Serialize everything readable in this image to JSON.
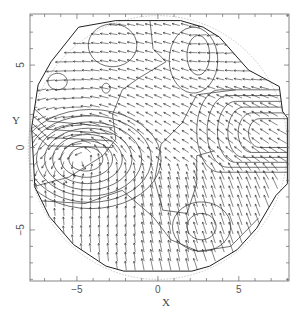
{
  "chart_data": {
    "type": "quiver",
    "title": "",
    "xlabel": "X",
    "ylabel": "Y",
    "xlim": [
      -7.9,
      8.1
    ],
    "ylim": [
      -8.1,
      8.1
    ],
    "x_ticks": [
      {
        "value": -5,
        "label": "−5"
      },
      {
        "value": 0,
        "label": "0"
      },
      {
        "value": 5,
        "label": "5"
      }
    ],
    "y_ticks": [
      {
        "value": 5,
        "label": "5"
      },
      {
        "value": 0,
        "label": "0"
      },
      {
        "value": -5,
        "label": "−5"
      }
    ],
    "minor_tick_step": 1,
    "grid": false,
    "legend": null,
    "domain_circle_radius": 8.0,
    "grid_spacing": 0.55,
    "features": [
      {
        "name": "vortex-left",
        "x": -4.5,
        "y": -0.3,
        "strength": 1.0
      },
      {
        "name": "sink-right",
        "x": 7.2,
        "y": 3.6,
        "strength": 0.9
      },
      {
        "name": "closed-contour-lower-right",
        "x": 2.7,
        "y": -4.8
      },
      {
        "name": "closed-contour-upper-right",
        "x": 2.5,
        "y": 5.6
      },
      {
        "name": "closed-contour-upper-left-small",
        "x": -3.2,
        "y": 3.6
      }
    ],
    "colors": {
      "arrows": "#222222",
      "contours": "#333333",
      "frame": "#555555",
      "domain_circle": "#bbbbbb"
    }
  }
}
